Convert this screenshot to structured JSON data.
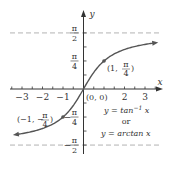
{
  "chart_data": {
    "type": "line",
    "title": "",
    "xlabel": "x",
    "ylabel": "y",
    "xlim": [
      -3.5,
      3.7
    ],
    "ylim": [
      -1.75,
      1.75
    ],
    "x_ticks": [
      -3,
      -2,
      -1,
      0,
      1,
      2,
      3
    ],
    "x_tick_labels": [
      {
        "value": -3,
        "text": "−3"
      },
      {
        "value": -2,
        "text": "−2"
      },
      {
        "value": -1,
        "text": "−1"
      },
      {
        "value": 2,
        "text": "2"
      },
      {
        "value": 3,
        "text": "3"
      }
    ],
    "y_tick_labels": [
      {
        "value": 1.5708,
        "num": "π",
        "den": "2",
        "sign": ""
      },
      {
        "value": 0.7854,
        "num": "π",
        "den": "4",
        "sign": ""
      },
      {
        "value": -0.7854,
        "num": "π",
        "den": "4",
        "sign": "−"
      },
      {
        "value": -1.5708,
        "num": "π",
        "den": "2",
        "sign": "−"
      }
    ],
    "asymptotes": [
      1.5708,
      -1.5708
    ],
    "series": [
      {
        "name": "y = arctan x",
        "function": "arctan",
        "x_range": [
          -3.3,
          3.5
        ],
        "color": "#555555"
      }
    ],
    "points": [
      {
        "x": 1,
        "y": 0.7854,
        "label_pre": "(1, ",
        "label_num": "π",
        "label_den": "4",
        "label_post": ")"
      },
      {
        "x": -1,
        "y": -0.7854,
        "label_pre": "(−1, −",
        "label_num": "π",
        "label_den": "4",
        "label_post": ")"
      },
      {
        "x": 0,
        "y": 0,
        "label": "(0, 0)"
      }
    ],
    "annotations": {
      "line1": "y = tan",
      "line1_sup": "−1",
      "line1_var": " x",
      "line2": "or",
      "line3": "y = arctan x"
    },
    "grid": false
  }
}
